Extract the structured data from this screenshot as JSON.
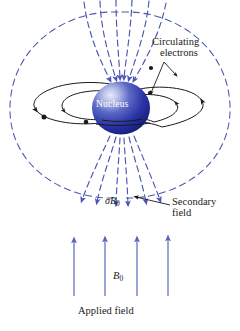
{
  "figure": {
    "kind": "physics-diagram",
    "labels": {
      "circulating_line1": "Circulating",
      "circulating_line2": "electrons",
      "nucleus": "Nucleus",
      "sigma_b0_symbol": "σB",
      "sigma_b0_subscript": "0",
      "secondary_line1": "Secondary",
      "secondary_line2": "field",
      "b0_symbol": "B",
      "b0_subscript": "0",
      "applied_field": "Applied field"
    },
    "colors": {
      "field_blue": "#4a56b0",
      "applied_arrow_blue": "#5661b8",
      "orbit_black": "#1a1a1a",
      "nucleus_core": "#1c2a9c",
      "nucleus_highlight": "#cfd6f2",
      "text": "#1a1a1a",
      "nucleus_text": "#ffffff",
      "background": "#ffffff"
    },
    "counts": {
      "secondary_field_loops": 2,
      "inner_converging_lines": 6,
      "electron_orbits": 2,
      "electron_markers": 4,
      "applied_field_arrows": 4
    }
  }
}
